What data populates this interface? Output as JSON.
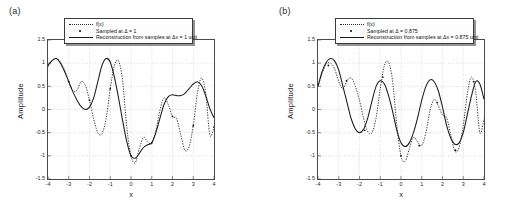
{
  "figure": {
    "panels": [
      {
        "label": "(a)",
        "legend": [
          {
            "key": "dotted-line",
            "text": "f(x)"
          },
          {
            "key": "point-marker",
            "text": "Sampled at Δ = 1"
          },
          {
            "key": "solid-line",
            "text": "Reconstruction from samples at Δx = 1 unit"
          }
        ]
      },
      {
        "label": "(b)",
        "legend": [
          {
            "key": "dotted-line",
            "text": "f(x)"
          },
          {
            "key": "point-marker",
            "text": "Sampled at Δ = 0.875"
          },
          {
            "key": "solid-line",
            "text": "Reconstruction from samples at Δx = 0.875 unit"
          }
        ]
      }
    ]
  },
  "chart_data": [
    {
      "type": "line",
      "title": "(a)",
      "xlabel": "x",
      "ylabel": "Amplitude",
      "xlim": [
        -4,
        4
      ],
      "ylim": [
        -1.5,
        1.5
      ],
      "xticks": [
        -4,
        -3,
        -2,
        -1,
        0,
        1,
        2,
        3,
        4
      ],
      "yticks": [
        -1.5,
        -1,
        -0.5,
        0,
        0.5,
        1,
        1.5
      ],
      "grid": true,
      "legend_position": "top-center",
      "sample_interval": 1,
      "series": [
        {
          "name": "f(x)",
          "style": "dotted",
          "x": [
            -4,
            -3.8,
            -3.6,
            -3.4,
            -3.2,
            -3,
            -2.8,
            -2.6,
            -2.4,
            -2.2,
            -2,
            -1.8,
            -1.6,
            -1.4,
            -1.2,
            -1,
            -0.8,
            -0.6,
            -0.4,
            -0.2,
            0,
            0.2,
            0.4,
            0.6,
            0.8,
            1,
            1.2,
            1.4,
            1.6,
            1.8,
            2,
            2.2,
            2.4,
            2.6,
            2.8,
            3,
            3.2,
            3.4,
            3.6,
            3.8,
            4
          ],
          "y": [
            0.95,
            1.05,
            1.1,
            1.02,
            0.85,
            0.6,
            0.4,
            0.42,
            0.6,
            0.52,
            0.2,
            -0.2,
            -0.5,
            -0.52,
            -0.2,
            0.45,
            0.95,
            1.05,
            0.6,
            -0.4,
            -1.0,
            -1.15,
            -0.85,
            -0.6,
            -0.7,
            -0.72,
            -0.45,
            0.0,
            0.25,
            0.1,
            -0.15,
            -0.2,
            -0.55,
            -0.88,
            -0.8,
            -0.35,
            0.35,
            0.68,
            0.35,
            -0.55,
            -0.38
          ]
        },
        {
          "name": "Sampled at Δ = 1",
          "style": "points",
          "x": [
            -4,
            -3,
            -2,
            -1,
            0,
            1,
            2,
            3,
            4
          ],
          "y": [
            0.95,
            0.6,
            0.2,
            0.45,
            -1.0,
            -0.72,
            -0.15,
            -0.35,
            -0.38
          ]
        },
        {
          "name": "Reconstruction from samples at Δx = 1 unit",
          "style": "solid",
          "x": [
            -4,
            -3.8,
            -3.6,
            -3.4,
            -3.2,
            -3,
            -2.8,
            -2.6,
            -2.4,
            -2.2,
            -2,
            -1.8,
            -1.6,
            -1.4,
            -1.2,
            -1,
            -0.8,
            -0.6,
            -0.4,
            -0.2,
            0,
            0.2,
            0.4,
            0.6,
            0.8,
            1,
            1.2,
            1.4,
            1.6,
            1.8,
            2,
            2.2,
            2.4,
            2.6,
            2.8,
            3,
            3.2,
            3.4,
            3.6,
            3.8,
            4
          ],
          "y": [
            0.95,
            1.06,
            1.1,
            1.0,
            0.82,
            0.6,
            0.38,
            0.2,
            0.06,
            0.0,
            0.05,
            0.25,
            0.6,
            0.95,
            1.1,
            1.02,
            0.7,
            0.25,
            -0.25,
            -0.7,
            -1.0,
            -1.05,
            -0.95,
            -0.82,
            -0.76,
            -0.72,
            -0.5,
            -0.18,
            0.12,
            0.28,
            0.32,
            0.3,
            0.3,
            0.35,
            0.45,
            0.55,
            0.6,
            0.52,
            0.3,
            0.02,
            -0.18
          ]
        }
      ]
    },
    {
      "type": "line",
      "title": "(b)",
      "xlabel": "x",
      "ylabel": "Amplitude",
      "xlim": [
        -4,
        4
      ],
      "ylim": [
        -1.5,
        1.5
      ],
      "xticks": [
        -4,
        -3,
        -2,
        -1,
        0,
        1,
        2,
        3,
        4
      ],
      "yticks": [
        -1.5,
        -1,
        -0.5,
        0,
        0.5,
        1,
        1.5
      ],
      "grid": true,
      "legend_position": "top-center",
      "sample_interval": 0.875,
      "series": [
        {
          "name": "f(x)",
          "style": "dotted",
          "x": [
            -4,
            -3.8,
            -3.6,
            -3.4,
            -3.2,
            -3,
            -2.8,
            -2.6,
            -2.4,
            -2.2,
            -2,
            -1.8,
            -1.6,
            -1.4,
            -1.2,
            -1,
            -0.8,
            -0.6,
            -0.4,
            -0.2,
            0,
            0.2,
            0.4,
            0.6,
            0.8,
            1,
            1.2,
            1.4,
            1.6,
            1.8,
            2,
            2.2,
            2.4,
            2.6,
            2.8,
            3,
            3.2,
            3.4,
            3.6,
            3.8,
            4
          ],
          "y": [
            0.5,
            0.78,
            0.98,
            1.0,
            0.88,
            0.6,
            0.45,
            0.62,
            0.68,
            0.5,
            0.2,
            -0.2,
            -0.48,
            -0.5,
            -0.18,
            0.45,
            0.95,
            1.02,
            0.6,
            -0.35,
            -1.0,
            -1.12,
            -0.85,
            -0.6,
            -0.7,
            -0.78,
            -0.5,
            -0.02,
            0.22,
            0.08,
            -0.12,
            -0.18,
            -0.55,
            -0.9,
            -0.82,
            -0.35,
            0.35,
            0.7,
            0.38,
            -0.5,
            -0.2
          ]
        },
        {
          "name": "Sampled at Δ = 0.875",
          "style": "points",
          "x": [
            -3.5,
            -2.625,
            -1.75,
            -0.875,
            0,
            0.875,
            1.75,
            2.625,
            3.5
          ],
          "y": [
            0.95,
            0.62,
            -0.45,
            0.7,
            -1.0,
            -0.78,
            0.15,
            -0.88,
            0.6
          ]
        },
        {
          "name": "Reconstruction from samples at Δx = 0.875 unit",
          "style": "solid",
          "x": [
            -4,
            -3.8,
            -3.6,
            -3.4,
            -3.2,
            -3,
            -2.8,
            -2.6,
            -2.4,
            -2.2,
            -2,
            -1.8,
            -1.6,
            -1.4,
            -1.2,
            -1,
            -0.8,
            -0.6,
            -0.4,
            -0.2,
            0,
            0.2,
            0.4,
            0.6,
            0.8,
            1,
            1.2,
            1.4,
            1.6,
            1.8,
            2,
            2.2,
            2.4,
            2.6,
            2.8,
            3,
            3.2,
            3.4,
            3.6,
            3.8,
            4
          ],
          "y": [
            0.5,
            0.82,
            1.02,
            1.1,
            1.05,
            0.85,
            0.5,
            0.15,
            -0.2,
            -0.42,
            -0.5,
            -0.42,
            -0.18,
            0.18,
            0.5,
            0.62,
            0.55,
            0.3,
            -0.05,
            -0.45,
            -0.72,
            -0.8,
            -0.72,
            -0.5,
            -0.18,
            0.2,
            0.5,
            0.64,
            0.6,
            0.4,
            0.05,
            -0.35,
            -0.62,
            -0.75,
            -0.72,
            -0.5,
            -0.1,
            0.3,
            0.6,
            0.55,
            0.22
          ]
        }
      ]
    }
  ]
}
